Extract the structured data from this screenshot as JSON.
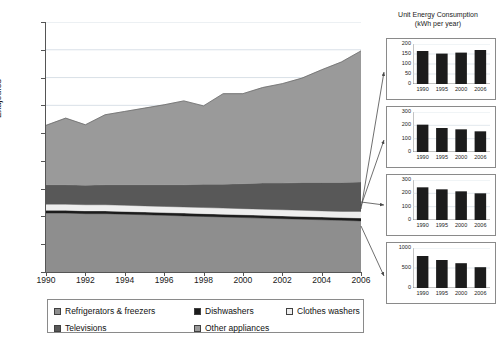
{
  "chart_data": [
    {
      "type": "area",
      "id": "main-stacked-area",
      "title": "",
      "xlabel": "",
      "ylabel": "Exajoules",
      "xlim": [
        1990,
        2006
      ],
      "ylim": [
        0.0,
        4.5
      ],
      "grid": true,
      "legend_position": "bottom",
      "x": [
        1990,
        1991,
        1992,
        1993,
        1994,
        1995,
        1996,
        1997,
        1998,
        1999,
        2000,
        2001,
        2002,
        2003,
        2004,
        2005,
        2006
      ],
      "xticks": [
        "1990",
        "1992",
        "1994",
        "1996",
        "1998",
        "2000",
        "2002",
        "2004",
        "2006"
      ],
      "yticks": [
        "0.0",
        "0.5",
        "1.0",
        "1.5",
        "2.0",
        "2.5",
        "3.0",
        "3.5",
        "4.0",
        "4.5"
      ],
      "stack_order": [
        "Refrigerators & freezers",
        "Dishwashers",
        "Clothes washers",
        "Televisions",
        "Other appliances"
      ],
      "series": [
        {
          "name": "Refrigerators & freezers",
          "color": "#8e8e8e",
          "values": [
            1.06,
            1.06,
            1.05,
            1.05,
            1.04,
            1.03,
            1.02,
            1.01,
            1.0,
            0.99,
            0.98,
            0.97,
            0.96,
            0.95,
            0.94,
            0.93,
            0.92
          ]
        },
        {
          "name": "Dishwashers",
          "color": "#1c1c1c",
          "values": [
            0.05,
            0.05,
            0.05,
            0.05,
            0.05,
            0.05,
            0.05,
            0.05,
            0.05,
            0.05,
            0.05,
            0.05,
            0.05,
            0.05,
            0.05,
            0.05,
            0.05
          ]
        },
        {
          "name": "Clothes washers",
          "color": "#eeeeee",
          "values": [
            0.11,
            0.11,
            0.11,
            0.11,
            0.11,
            0.11,
            0.11,
            0.11,
            0.11,
            0.11,
            0.11,
            0.11,
            0.11,
            0.11,
            0.11,
            0.11,
            0.12
          ]
        },
        {
          "name": "Televisions",
          "color": "#585858",
          "values": [
            0.35,
            0.35,
            0.35,
            0.36,
            0.37,
            0.38,
            0.39,
            0.4,
            0.42,
            0.43,
            0.45,
            0.47,
            0.48,
            0.5,
            0.51,
            0.52,
            0.53
          ]
        },
        {
          "name": "Other appliances",
          "color": "#9a9a9a",
          "values": [
            1.07,
            1.2,
            1.09,
            1.26,
            1.32,
            1.38,
            1.44,
            1.51,
            1.41,
            1.63,
            1.62,
            1.72,
            1.79,
            1.88,
            2.03,
            2.17,
            2.36
          ]
        }
      ],
      "totals": [
        2.64,
        2.77,
        2.65,
        2.83,
        2.89,
        2.95,
        3.01,
        3.08,
        2.99,
        3.21,
        3.21,
        3.32,
        3.39,
        3.49,
        3.64,
        3.78,
        3.98
      ]
    },
    {
      "type": "bar",
      "id": "inset-refrigerators",
      "title": "Unit Energy Consumption",
      "subtitle": "(kWh per year)",
      "series_name": "Dishwashers",
      "categories": [
        "1990",
        "1995",
        "2000",
        "2006"
      ],
      "values": [
        165,
        152,
        157,
        170
      ],
      "ylim": [
        0,
        200
      ],
      "yticks": [
        "0",
        "50",
        "100",
        "150",
        "200"
      ],
      "bar_color": "#1c1c1c"
    },
    {
      "type": "bar",
      "id": "inset-clothes-washers",
      "series_name": "Clothes washers",
      "categories": [
        "1990",
        "1995",
        "2000",
        "2006"
      ],
      "values": [
        205,
        180,
        170,
        155
      ],
      "ylim": [
        0,
        300
      ],
      "yticks": [
        "0",
        "100",
        "200",
        "300"
      ],
      "bar_color": "#1c1c1c"
    },
    {
      "type": "bar",
      "id": "inset-televisions",
      "series_name": "Televisions",
      "categories": [
        "1990",
        "1995",
        "2000",
        "2006"
      ],
      "values": [
        245,
        230,
        215,
        200
      ],
      "ylim": [
        0,
        300
      ],
      "yticks": [
        "0",
        "100",
        "200",
        "300"
      ],
      "bar_color": "#1c1c1c"
    },
    {
      "type": "bar",
      "id": "inset-refrigerators-freezers",
      "series_name": "Refrigerators & freezers",
      "categories": [
        "1990",
        "1995",
        "2000",
        "2006"
      ],
      "values": [
        800,
        700,
        620,
        520
      ],
      "ylim": [
        0,
        1000
      ],
      "yticks": [
        "0",
        "500",
        "1000"
      ],
      "bar_color": "#1c1c1c"
    }
  ],
  "main": {
    "y_axis_title": "Exajoules",
    "yticks": [
      "4.5",
      "4.0",
      "3.5",
      "3.0",
      "2.5",
      "2.0",
      "1.5",
      "1.0",
      "0.5",
      "0.0"
    ],
    "xticks": [
      "1990",
      "1992",
      "1994",
      "1996",
      "1998",
      "2000",
      "2002",
      "2004",
      "2006"
    ]
  },
  "legend": {
    "items": [
      {
        "label": "Refrigerators & freezers",
        "color": "#8e8e8e"
      },
      {
        "label": "Dishwashers",
        "color": "#1c1c1c"
      },
      {
        "label": "Clothes washers",
        "color": "#eeeeee"
      },
      {
        "label": "Televisions",
        "color": "#585858"
      },
      {
        "label": "Other appliances",
        "color": "#9a9a9a"
      }
    ]
  },
  "insets": {
    "title_line1": "Unit Energy Consumption",
    "title_line2": "(kWh per year)"
  }
}
